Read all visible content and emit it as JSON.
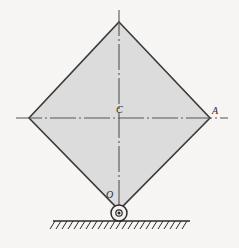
{
  "figure": {
    "background_color": "#f7f6f4",
    "labels": {
      "center": "C",
      "right_vertex": "A",
      "pivot": "O"
    },
    "plate": {
      "shape": "square-rotated-45",
      "fill_color": "#dcdcdc",
      "stroke_color": "#3a3a3a",
      "stroke_width": 1.6,
      "vertices": [
        {
          "name": "top",
          "x": 119,
          "y": 22
        },
        {
          "name": "right",
          "x": 210,
          "y": 118
        },
        {
          "name": "bottom",
          "x": 119,
          "y": 210
        },
        {
          "name": "left",
          "x": 29,
          "y": 118
        }
      ]
    },
    "centerlines": {
      "style": "dash-dot",
      "color": "#555555",
      "horizontal": {
        "x1": 16,
        "y1": 118,
        "x2": 228,
        "y2": 118
      },
      "vertical": {
        "x1": 119,
        "y1": 10,
        "x2": 119,
        "y2": 210
      }
    },
    "pin_support": {
      "type": "pin-joint",
      "center_x": 119,
      "center_y": 213,
      "outer_radius": 8,
      "inner_radius": 3.2,
      "hub_radius": 1.5,
      "stroke_color": "#2b2b2b",
      "fill_color": "#f2f1ef"
    },
    "ground": {
      "line": {
        "x1": 53,
        "y1": 221,
        "x2": 190,
        "y2": 221
      },
      "color": "#2b2b2b",
      "hatch_count": 23,
      "hatch_length": 9,
      "hatch_angle_deg": 60
    }
  }
}
